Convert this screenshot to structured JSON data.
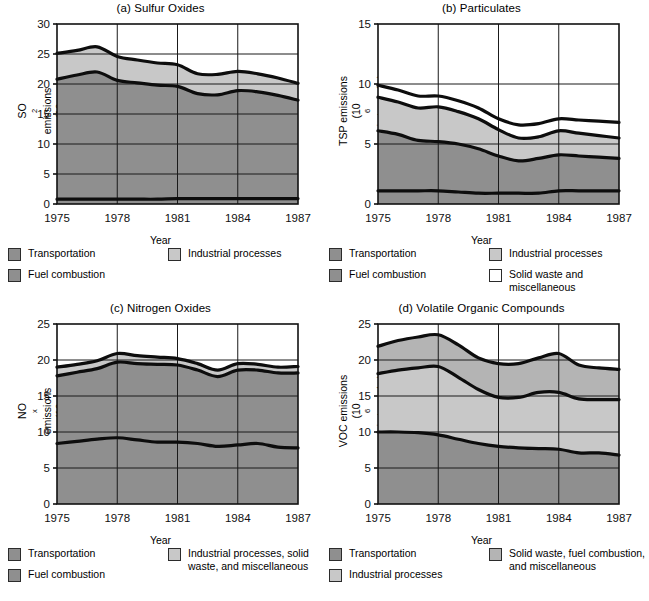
{
  "figure": {
    "xlabel": "Year"
  },
  "colors": {
    "transportation": "#8f8f8f",
    "fuel_combustion": "#8f8f8f",
    "industrial": "#c8c8c8",
    "solid_waste": "#ffffff",
    "ink": "#111111",
    "grid": "#222222"
  },
  "panels": [
    {
      "key": "a",
      "title": "(a) Sulfur Oxides",
      "ylabel_line1": "SO2 emissions",
      "ylabel_line2": "(106 metric tones/yr)",
      "legend": [
        {
          "label": "Transportation",
          "swatch": "#8f8f8f"
        },
        {
          "label": "Fuel combustion",
          "swatch": "#8f8f8f"
        },
        {
          "label": "Industrial processes",
          "swatch": "#c8c8c8"
        }
      ]
    },
    {
      "key": "b",
      "title": "(b) Particulates",
      "ylabel_line1": "TSP emissions",
      "ylabel_line2": "(106 metric tones/yr)",
      "legend": [
        {
          "label": "Transportation",
          "swatch": "#8f8f8f"
        },
        {
          "label": "Fuel combustion",
          "swatch": "#8f8f8f"
        },
        {
          "label": "Industrial processes",
          "swatch": "#c8c8c8"
        },
        {
          "label": "Solid waste and miscellaneous",
          "swatch": "#ffffff"
        }
      ]
    },
    {
      "key": "c",
      "title": "(c) Nitrogen Oxides",
      "ylabel_line1": "NOx emissions",
      "ylabel_line2": "(106 metric tones/yr)",
      "legend": [
        {
          "label": "Transportation",
          "swatch": "#8f8f8f"
        },
        {
          "label": "Fuel combustion",
          "swatch": "#8f8f8f"
        },
        {
          "label": "Industrial processes, solid waste, and miscellaneous",
          "swatch": "#c8c8c8"
        }
      ]
    },
    {
      "key": "d",
      "title": "(d) Volatile Organic Compounds",
      "ylabel_line1": "VOC emissions",
      "ylabel_line2": "(106 metric tones/yr)",
      "legend": [
        {
          "label": "Transportation",
          "swatch": "#8f8f8f"
        },
        {
          "label": "Industrial processes",
          "swatch": "#c8c8c8"
        },
        {
          "label": "Solid waste, fuel combustion, and miscellaneous",
          "swatch": "#b4b4b4"
        }
      ]
    }
  ],
  "chart_data": [
    {
      "type": "area",
      "id": "a",
      "title": "(a) Sulfur Oxides",
      "xlabel": "Year",
      "ylabel": "SO2 emissions (10^6 metric tones/yr)",
      "xlim": [
        1975,
        1987
      ],
      "ylim": [
        0,
        30
      ],
      "yticks": [
        0,
        5,
        10,
        15,
        20,
        25,
        30
      ],
      "xticks": [
        1975,
        1978,
        1981,
        1984,
        1987
      ],
      "grid": true,
      "legend_position": "below",
      "x": [
        1975,
        1976,
        1977,
        1978,
        1979,
        1980,
        1981,
        1982,
        1983,
        1984,
        1985,
        1986,
        1987
      ],
      "series": [
        {
          "name": "Transportation",
          "color": "#8f8f8f",
          "values": [
            0.8,
            0.8,
            0.8,
            0.8,
            0.8,
            0.8,
            0.9,
            0.9,
            0.9,
            0.9,
            0.9,
            0.9,
            0.9
          ]
        },
        {
          "name": "Fuel combustion",
          "color": "#8f8f8f",
          "values": [
            20.0,
            20.7,
            21.2,
            19.8,
            19.4,
            19.0,
            18.7,
            17.5,
            17.3,
            18.0,
            17.8,
            17.2,
            16.4
          ]
        },
        {
          "name": "Industrial processes",
          "color": "#c8c8c8",
          "values": [
            4.3,
            4.1,
            4.2,
            4.0,
            3.8,
            3.7,
            3.6,
            3.3,
            3.4,
            3.2,
            3.0,
            2.9,
            2.8
          ]
        }
      ],
      "cumulative_top": [
        25.1,
        25.6,
        26.2,
        24.6,
        24.0,
        23.5,
        23.2,
        21.7,
        21.6,
        22.1,
        21.7,
        21.0,
        20.1
      ]
    },
    {
      "type": "area",
      "id": "b",
      "title": "(b) Particulates",
      "xlabel": "Year",
      "ylabel": "TSP emissions (10^6 metric tones/yr)",
      "xlim": [
        1975,
        1987
      ],
      "ylim": [
        0,
        15
      ],
      "yticks": [
        0,
        5,
        10,
        15
      ],
      "xticks": [
        1975,
        1978,
        1981,
        1984,
        1987
      ],
      "grid": true,
      "legend_position": "below",
      "x": [
        1975,
        1976,
        1977,
        1978,
        1979,
        1980,
        1981,
        1982,
        1983,
        1984,
        1985,
        1986,
        1987
      ],
      "series": [
        {
          "name": "Transportation",
          "color": "#8f8f8f",
          "values": [
            1.1,
            1.1,
            1.1,
            1.1,
            1.0,
            0.9,
            0.9,
            0.9,
            0.9,
            1.1,
            1.1,
            1.1,
            1.1
          ]
        },
        {
          "name": "Fuel combustion",
          "color": "#8f8f8f",
          "values": [
            5.0,
            4.7,
            4.2,
            4.1,
            4.0,
            3.7,
            3.1,
            2.7,
            2.9,
            3.0,
            2.9,
            2.8,
            2.7
          ]
        },
        {
          "name": "Industrial processes",
          "color": "#c8c8c8",
          "values": [
            2.8,
            2.7,
            2.7,
            2.9,
            2.7,
            2.5,
            2.2,
            1.9,
            1.8,
            2.0,
            1.9,
            1.8,
            1.7
          ]
        },
        {
          "name": "Solid waste and miscellaneous",
          "color": "#ffffff",
          "values": [
            1.0,
            1.0,
            1.0,
            0.9,
            0.9,
            0.9,
            0.9,
            1.1,
            1.1,
            1.0,
            1.1,
            1.2,
            1.3
          ]
        }
      ],
      "cumulative_top": [
        9.9,
        9.5,
        9.0,
        9.0,
        8.6,
        8.0,
        7.1,
        6.6,
        6.7,
        7.1,
        7.0,
        6.9,
        6.8
      ]
    },
    {
      "type": "area",
      "id": "c",
      "title": "(c) Nitrogen Oxides",
      "xlabel": "Year",
      "ylabel": "NOx emissions (10^6 metric tones/yr)",
      "xlim": [
        1975,
        1987
      ],
      "ylim": [
        0,
        25
      ],
      "yticks": [
        0,
        5,
        10,
        15,
        20,
        25
      ],
      "xticks": [
        1975,
        1978,
        1981,
        1984,
        1987
      ],
      "grid": true,
      "legend_position": "below",
      "x": [
        1975,
        1976,
        1977,
        1978,
        1979,
        1980,
        1981,
        1982,
        1983,
        1984,
        1985,
        1986,
        1987
      ],
      "series": [
        {
          "name": "Transportation",
          "color": "#8f8f8f",
          "values": [
            8.4,
            8.7,
            9.0,
            9.2,
            8.9,
            8.6,
            8.6,
            8.4,
            8.0,
            8.2,
            8.4,
            7.9,
            7.8
          ]
        },
        {
          "name": "Fuel combustion",
          "color": "#8f8f8f",
          "values": [
            9.4,
            9.6,
            9.8,
            10.5,
            10.6,
            10.8,
            10.7,
            10.2,
            9.7,
            10.4,
            10.2,
            10.3,
            10.4
          ]
        },
        {
          "name": "Industrial processes, solid waste, and miscellaneous",
          "color": "#c8c8c8",
          "values": [
            1.2,
            1.1,
            1.1,
            1.2,
            1.1,
            1.0,
            0.9,
            0.9,
            0.9,
            0.9,
            0.8,
            0.8,
            0.9
          ]
        }
      ],
      "cumulative_top": [
        19.0,
        19.4,
        19.9,
        20.9,
        20.6,
        20.4,
        20.2,
        19.5,
        18.6,
        19.5,
        19.4,
        19.0,
        19.1
      ]
    },
    {
      "type": "area",
      "id": "d",
      "title": "(d) Volatile Organic Compounds",
      "xlabel": "Year",
      "ylabel": "VOC emissions (10^6 metric tones/yr)",
      "xlim": [
        1975,
        1987
      ],
      "ylim": [
        0,
        25
      ],
      "yticks": [
        0,
        5,
        10,
        15,
        20,
        25
      ],
      "xticks": [
        1975,
        1978,
        1981,
        1984,
        1987
      ],
      "grid": true,
      "legend_position": "below",
      "x": [
        1975,
        1976,
        1977,
        1978,
        1979,
        1980,
        1981,
        1982,
        1983,
        1984,
        1985,
        1986,
        1987
      ],
      "series": [
        {
          "name": "Transportation",
          "color": "#8f8f8f",
          "values": [
            10.0,
            10.0,
            9.9,
            9.6,
            9.0,
            8.4,
            8.0,
            7.8,
            7.7,
            7.6,
            7.1,
            7.1,
            6.8
          ]
        },
        {
          "name": "Industrial processes",
          "color": "#c8c8c8",
          "values": [
            8.1,
            8.6,
            9.0,
            9.5,
            8.6,
            7.5,
            6.8,
            7.0,
            7.8,
            7.9,
            7.5,
            7.4,
            7.7
          ]
        },
        {
          "name": "Solid waste, fuel combustion, and miscellaneous",
          "color": "#b4b4b4",
          "values": [
            3.8,
            4.1,
            4.3,
            4.4,
            4.5,
            4.4,
            4.7,
            4.7,
            4.8,
            5.4,
            4.7,
            4.4,
            4.2
          ]
        }
      ],
      "cumulative_top": [
        21.9,
        22.7,
        23.2,
        23.5,
        22.1,
        20.3,
        19.5,
        19.5,
        20.3,
        20.9,
        19.3,
        18.9,
        18.7
      ]
    }
  ]
}
